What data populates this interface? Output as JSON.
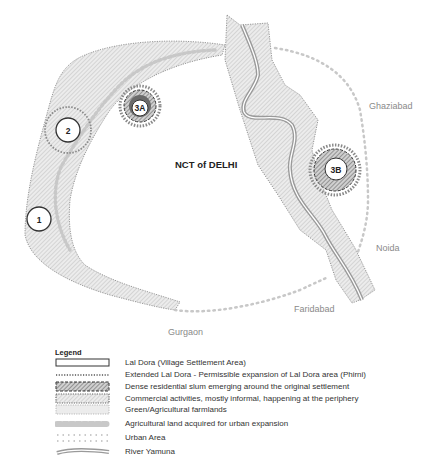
{
  "map": {
    "region_label": "NCT of DELHI",
    "neighbours": {
      "ghaziabad": "Ghaziabad",
      "noida": "Noida",
      "faridabad": "Faridabad",
      "gurgaon": "Gurgaon"
    },
    "settlements": [
      {
        "id": "1",
        "label": "1"
      },
      {
        "id": "2",
        "label": "2"
      },
      {
        "id": "3A",
        "label": "3A"
      },
      {
        "id": "3B",
        "label": "3B"
      }
    ],
    "colors": {
      "hatch_fill": "#d9d9d9",
      "boundary": "#8c8c8c",
      "dense_slum": "#555555",
      "river": "#9a9a9a",
      "urban_dots": "#c8c8c8"
    }
  },
  "legend": {
    "title": "Legend",
    "items": [
      {
        "symbol": "lal-dora",
        "label": "Lal Dora (Village Settlement Area)"
      },
      {
        "symbol": "extended-lal-dora",
        "label": "Extended Lal Dora - Permissible expansion of Lal Dora area (Phirni)"
      },
      {
        "symbol": "dense-slum",
        "label": "Dense residential slum emerging around the original settlement"
      },
      {
        "symbol": "commercial",
        "label": "Commercial activities, mostly informal, happening at the periphery"
      },
      {
        "symbol": "farmland",
        "label": "Green/Agricultural farmlands"
      },
      {
        "symbol": "acquired-land",
        "label": "Agricultural land acquired for urban expansion"
      },
      {
        "symbol": "urban-area",
        "label": "Urban Area"
      },
      {
        "symbol": "river",
        "label": "River Yamuna"
      }
    ]
  }
}
